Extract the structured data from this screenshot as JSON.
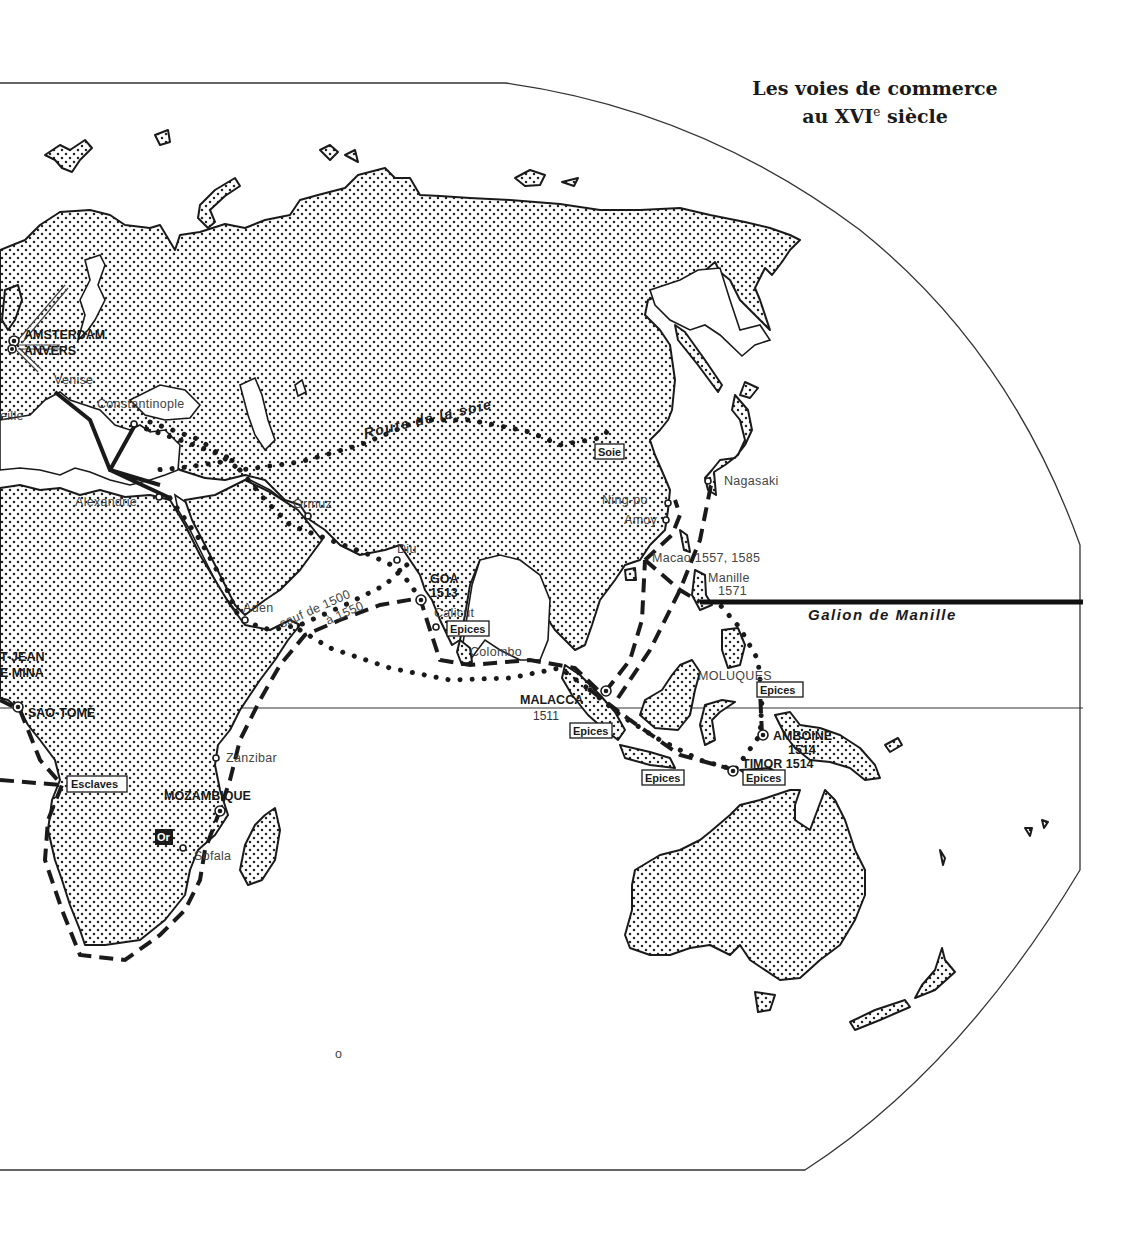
{
  "title": {
    "line1": "Les voies de commerce",
    "line2_prefix": "au XVI",
    "line2_sup": "e",
    "line2_suffix": " siècle"
  },
  "routes": {
    "silk_road": "Route de la soie",
    "manila_galleon": "Galion de Manille",
    "cape_exception_1": "sauf de 1500",
    "cape_exception_2": "à 1550"
  },
  "places": {
    "amsterdam": "AMSTERDAM",
    "anvers": "ANVERS",
    "venise": "Venise",
    "marseille_partial": "eille",
    "constantinople": "Constantinople",
    "alexandrie": "Alexandrie",
    "ormuz": "Ormuz",
    "aden": "Aden",
    "diu": "Diu",
    "goa": "GOA",
    "goa_year": "1513",
    "calicut": "Calicut",
    "colombo": "Colombo",
    "malacca": "MALACCA",
    "malacca_year": "1511",
    "moluques": "MOLUQUES",
    "amboine": "AMBOINE",
    "amboine_year": "1514",
    "timor": "TIMOR 1514",
    "ningpo": "Ning-po",
    "amoy": "Amoy",
    "macao": "Macao 1557, 1585",
    "manille": "Manille",
    "manille_year": "1571",
    "nagasaki": "Nagasaki",
    "saint_jean_partial": "T-JEAN",
    "mina_partial": "E MINA",
    "sao_tome": "SAO-TOMÉ",
    "zanzibar": "Zanzibar",
    "mozambique": "MOZAMBIQUE",
    "sofala": "Sofala"
  },
  "goods": {
    "soie": "Soie",
    "epices": "Epices",
    "esclaves": "Esclaves",
    "or": "Or"
  },
  "legend_styles": {
    "dashed": "Portuguese sea routes",
    "dotted": "Arab / Asian routes",
    "solid": "Mediterranean routes"
  },
  "colors": {
    "ink": "#1a1a1a",
    "paper": "#ffffff",
    "label_grey": "#444444"
  }
}
